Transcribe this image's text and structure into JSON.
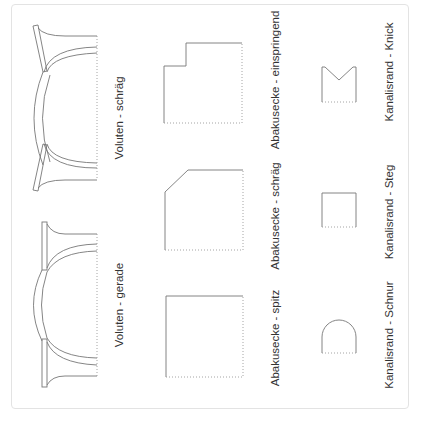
{
  "diagram": {
    "colors": {
      "stroke": "#777777",
      "dotted": "#9a9a9a",
      "text": "#333333",
      "frame": "#e3e3e3"
    },
    "labels": [
      {
        "id": "voluten-schraeg",
        "text": "Voluten - schräg",
        "x": 119,
        "y": 118
      },
      {
        "id": "voluten-gerade",
        "text": "Voluten - gerade",
        "x": 119,
        "y": 305
      },
      {
        "id": "abakusecke-einspringend",
        "text": "Abakusecke - einspringend",
        "x": 275,
        "y": 80
      },
      {
        "id": "abakusecke-schraeg",
        "text": "Abakusecke - schräg",
        "x": 275,
        "y": 216
      },
      {
        "id": "abakusecke-spitz",
        "text": "Abakusecke - spitz",
        "x": 275,
        "y": 338
      },
      {
        "id": "kanalisrand-knick",
        "text": "Kanalisrand - Knick",
        "x": 389,
        "y": 72
      },
      {
        "id": "kanalisrand-steg",
        "text": "Kanalisrand - Steg",
        "x": 389,
        "y": 212
      },
      {
        "id": "kanalisrand-schnur",
        "text": "Kanalisrand - Schnur",
        "x": 389,
        "y": 335
      }
    ]
  }
}
